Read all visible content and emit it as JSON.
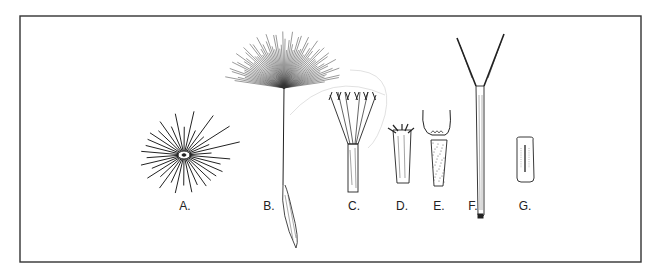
{
  "figure": {
    "labels": [
      {
        "id": "A",
        "text": "A."
      },
      {
        "id": "B",
        "text": "B."
      },
      {
        "id": "C",
        "text": "C."
      },
      {
        "id": "D",
        "text": "D."
      },
      {
        "id": "E",
        "text": "E."
      },
      {
        "id": "F",
        "text": "F."
      },
      {
        "id": "G",
        "text": "G."
      }
    ],
    "line_color": "#222222",
    "frame_color": "#333333"
  }
}
